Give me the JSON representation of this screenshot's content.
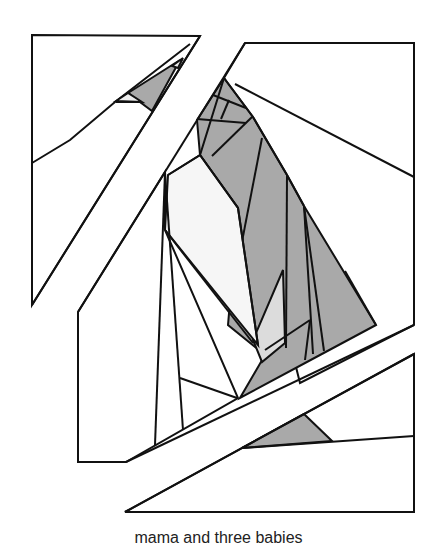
{
  "caption": "mama and three babies",
  "colors": {
    "stroke": "#111111",
    "background": "#ffffff",
    "gray_fill": "#a9a9a9",
    "light_gray_fill": "#dcdcdc",
    "very_light_fill": "#f4f4f4"
  },
  "illustration": {
    "description": "Line-art quilt pattern of abstract birds (a mother and three babies) cut by diagonal white bands",
    "pieces": [
      "top-left-panel",
      "top-right-panel",
      "center-left-panel",
      "bottom-right-panel",
      "center-gray-figure",
      "small-gray-figure-top-left",
      "small-gray-figure-bottom"
    ]
  }
}
